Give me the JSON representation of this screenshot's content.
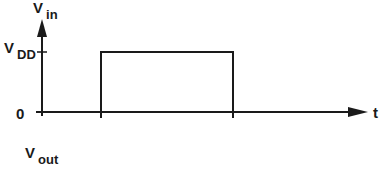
{
  "diagram": {
    "type": "timing-waveform",
    "y_axis_label": {
      "main": "V",
      "sub": "in"
    },
    "x_axis_label": "t",
    "levels": [
      {
        "main": "V",
        "sub": "DD"
      },
      {
        "main": "0",
        "sub": ""
      }
    ],
    "output_label": {
      "main": "V",
      "sub": "out"
    },
    "pulse": {
      "start_x": 101,
      "end_x": 233,
      "high_y": 52,
      "low_y": 112
    },
    "colors": {
      "line": "#1a1a1a",
      "background": "#ffffff"
    }
  }
}
